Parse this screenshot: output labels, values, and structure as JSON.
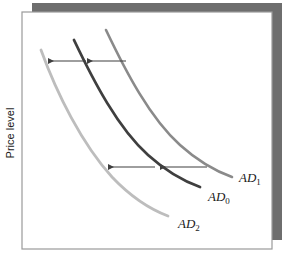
{
  "figure": {
    "type": "aggregate-demand-shift-diagram",
    "background_color": "#ffffff",
    "shadow_color": "#6e6e6e",
    "frame_color": "#9a9a9a"
  },
  "axes": {
    "y_label": "Price level",
    "x_label": "",
    "plot_box": {
      "left": 22,
      "top": 12,
      "right": 272,
      "bottom": 249
    },
    "ticks": [],
    "grid": false
  },
  "curves": [
    {
      "id": "AD1",
      "label": "AD",
      "subscript": "1",
      "color": "#8a8a8a",
      "width": 2.6,
      "role": "initial-aggregate-demand-right",
      "path": "M106,30 C126,72 150,118 180,145 C200,163 218,172 232,177",
      "label_x": 239,
      "label_y": 182
    },
    {
      "id": "AD0",
      "label": "AD",
      "subscript": "0",
      "color": "#3f3f3f",
      "width": 2.8,
      "role": "middle-aggregate-demand",
      "path": "M74,40 C94,82 118,128 148,155 C168,173 186,182 200,187",
      "label_x": 208,
      "label_y": 201
    },
    {
      "id": "AD2",
      "label": "AD",
      "subscript": "2",
      "color": "#bdbdbd",
      "width": 2.8,
      "role": "final-aggregate-demand-left",
      "path": "M41,50 C57,94 82,144 112,177 C132,198 152,210 168,216",
      "label_x": 178,
      "label_y": 228
    }
  ],
  "arrows": [
    {
      "id": "upper-arrow-right",
      "direction": "left",
      "color": "#3f3f3f",
      "x1": 126,
      "x2": 87,
      "y": 61,
      "meaning": "shift from AD1 to AD0"
    },
    {
      "id": "upper-arrow-left",
      "direction": "left",
      "color": "#3f3f3f",
      "x1": 86,
      "x2": 48,
      "y": 61,
      "meaning": "shift from AD0 to AD2"
    },
    {
      "id": "lower-arrow-right",
      "direction": "left",
      "color": "#3f3f3f",
      "x1": 207,
      "x2": 160,
      "y": 167,
      "meaning": "shift from AD1 to AD0"
    },
    {
      "id": "lower-arrow-left",
      "direction": "left",
      "color": "#3f3f3f",
      "x1": 155,
      "x2": 108,
      "y": 167,
      "meaning": "shift from AD0 to AD2"
    }
  ]
}
